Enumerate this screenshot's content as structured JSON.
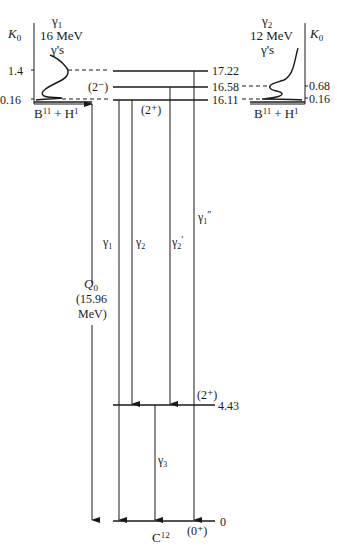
{
  "diagram": {
    "type": "nuclear-energy-level-diagram",
    "nucleus_label": "C",
    "nucleus_mass": "12",
    "reaction_label_left": {
      "a": "B",
      "a_mass": "11",
      "plus": "+",
      "b": "H",
      "b_mass": "1"
    },
    "reaction_label_right": {
      "a": "B",
      "a_mass": "11",
      "plus": "+",
      "b": "H",
      "b_mass": "1"
    },
    "levels": [
      {
        "energy": "17.22",
        "spin": ""
      },
      {
        "energy": "16.58",
        "spin": "(2⁻)"
      },
      {
        "energy": "16.11",
        "spin": "(2⁺)"
      },
      {
        "energy": "4.43",
        "spin": "(2⁺)"
      },
      {
        "energy": "0",
        "spin": "(0⁺)"
      }
    ],
    "transitions": [
      {
        "label": "γ",
        "sub": "1",
        "mark": "",
        "from": "16.11",
        "to": "0"
      },
      {
        "label": "γ",
        "sub": "2",
        "mark": "",
        "from": "16.11",
        "to": "4.43"
      },
      {
        "label": "γ",
        "sub": "2",
        "mark": "′",
        "from": "16.58",
        "to": "4.43"
      },
      {
        "label": "γ",
        "sub": "1",
        "mark": "″",
        "from": "17.22",
        "to": "0"
      },
      {
        "label": "γ",
        "sub": "3",
        "mark": "",
        "from": "4.43",
        "to": "0"
      }
    ],
    "q_value": {
      "symbol": "Q",
      "sub": "0",
      "value_line": "(15.96",
      "unit_line": "MeV)"
    },
    "left_spectrum": {
      "axis_label": "K",
      "axis_sub": "0",
      "title_gamma": "γ",
      "title_sub": "1",
      "energy": "16 MeV",
      "suffix": "γ's",
      "ticks": [
        "1.4",
        "0.16"
      ]
    },
    "right_spectrum": {
      "axis_label": "K",
      "axis_sub": "0",
      "title_gamma": "γ",
      "title_sub": "2",
      "energy": "12 MeV",
      "suffix": "γ's",
      "ticks": [
        "0.68",
        "0.16"
      ]
    }
  }
}
